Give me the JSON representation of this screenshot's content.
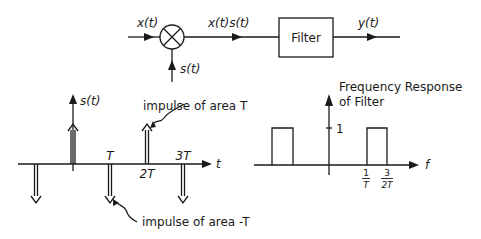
{
  "block_diagram": {
    "input_label": "x(t)",
    "modulator_output_label": "x(t)s(t)",
    "carrier_label": "s(t)",
    "filter_label": "Filter",
    "output_label": "y(t)"
  },
  "impulse_train": {
    "signal_label": "s(t)",
    "axis_label": "t",
    "tick_labels": [
      "T",
      "2T",
      "3T"
    ],
    "annotation_positive": "impulse of area T",
    "annotation_negative": "impulse of area -T",
    "impulses": [
      {
        "t": "-T",
        "sign": "negative"
      },
      {
        "t": "0",
        "sign": "positive"
      },
      {
        "t": "T",
        "sign": "negative"
      },
      {
        "t": "2T",
        "sign": "positive"
      },
      {
        "t": "3T",
        "sign": "negative"
      }
    ]
  },
  "frequency_response": {
    "title_line1": "Frequency Response",
    "title_line2": "of Filter",
    "axis_label": "f",
    "amplitude_tick": "1",
    "tick_1_num": "1",
    "tick_1_den": "T",
    "tick_2_num": "3",
    "tick_2_den": "2T"
  }
}
